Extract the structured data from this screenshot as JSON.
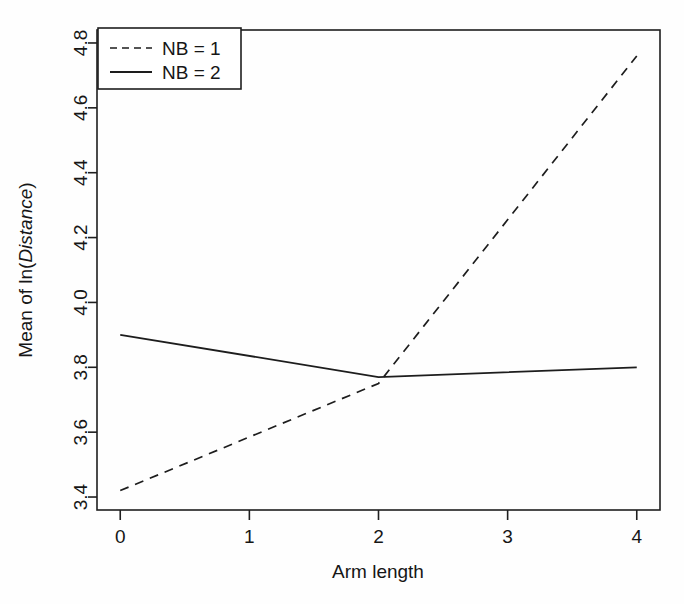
{
  "chart_data": {
    "type": "line",
    "title": "",
    "subtitle": "",
    "xlabel": "Arm length",
    "ylabel_prefix": "Mean of ln(",
    "ylabel_italic": "Distance",
    "ylabel_suffix": ")",
    "ylabel_plain": "Mean of ln(Distance)",
    "x": [
      0,
      2,
      4
    ],
    "xlim": [
      -0.18,
      4.18
    ],
    "ylim": [
      3.36,
      4.84
    ],
    "xticks": [
      0,
      1,
      2,
      3,
      4
    ],
    "xtick_labels": [
      "0",
      "1",
      "2",
      "3",
      "4"
    ],
    "yticks": [
      3.4,
      3.6,
      3.8,
      4.0,
      4.2,
      4.4,
      4.6,
      4.8
    ],
    "ytick_labels": [
      "3.4",
      "3.6",
      "3.8",
      "4.0",
      "4.2",
      "4.4",
      "4.6",
      "4.8"
    ],
    "grid": false,
    "legend_position": "upper-left",
    "series": [
      {
        "name": "NB = 1",
        "style": "dashed",
        "color": "#1d1d1d",
        "values": [
          3.42,
          3.75,
          4.76
        ]
      },
      {
        "name": "NB = 2",
        "style": "solid",
        "color": "#1d1d1d",
        "values": [
          3.9,
          3.77,
          3.8
        ]
      }
    ]
  },
  "legend": {
    "entries": [
      {
        "label": "NB = 1",
        "style": "dashed"
      },
      {
        "label": "NB = 2",
        "style": "solid"
      }
    ]
  },
  "colors": {
    "ink": "#1d1d1d",
    "background": "#fefefe"
  }
}
